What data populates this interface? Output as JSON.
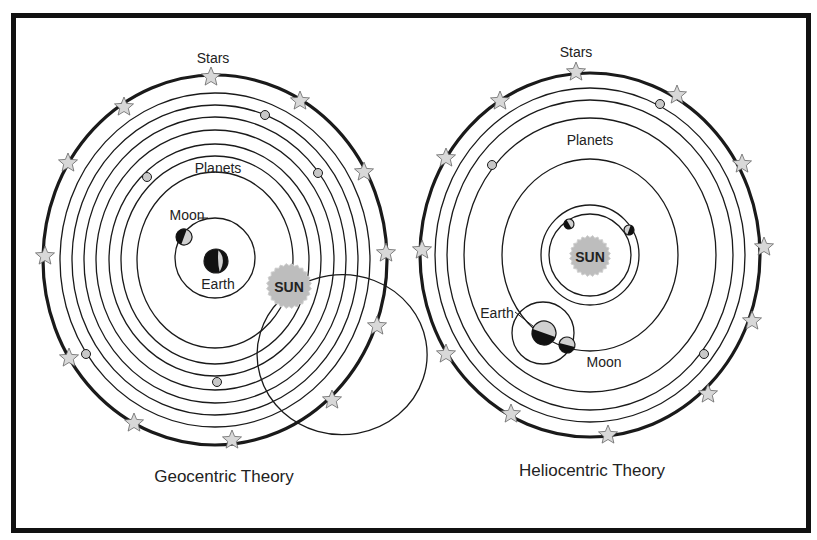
{
  "geocentric": {
    "title": "Geocentric Theory",
    "labels": {
      "stars": "Stars",
      "planets": "Planets",
      "moon": "Moon",
      "earth": "Earth",
      "sun": "SUN"
    },
    "center": [
      215,
      260
    ],
    "outer": [
      172,
      185
    ],
    "orbits": [
      [
        155,
        167
      ],
      [
        143,
        155
      ],
      [
        131,
        143
      ],
      [
        119,
        130
      ],
      [
        106,
        116
      ],
      [
        94,
        104
      ],
      [
        78,
        88
      ]
    ],
    "planets": [
      [
        265,
        115
      ],
      [
        318,
        173
      ],
      [
        147,
        177
      ],
      [
        86,
        354
      ],
      [
        217,
        382
      ]
    ],
    "stars": [
      [
        211,
        77
      ],
      [
        124,
        107
      ],
      [
        300,
        101
      ],
      [
        68,
        163
      ],
      [
        364,
        172
      ],
      [
        45,
        256
      ],
      [
        386,
        253
      ],
      [
        69,
        358
      ],
      [
        377,
        326
      ],
      [
        134,
        423
      ],
      [
        332,
        400
      ],
      [
        232,
        440
      ]
    ]
  },
  "heliocentric": {
    "title": "Heliocentric Theory",
    "labels": {
      "stars": "Stars",
      "planets": "Planets",
      "earth": "Earth",
      "moon": "Moon",
      "sun": "SUN"
    },
    "center": [
      590,
      255
    ],
    "outer": [
      170,
      182
    ],
    "orbits": [
      [
        155,
        167
      ],
      [
        143,
        155
      ],
      [
        126,
        137
      ],
      [
        88,
        96
      ],
      [
        49,
        50
      ],
      [
        41,
        41
      ]
    ],
    "planets": [
      [
        660,
        104
      ],
      [
        492,
        165
      ],
      [
        569,
        224
      ],
      [
        629,
        230
      ],
      [
        704,
        354
      ]
    ],
    "stars": [
      [
        576,
        72
      ],
      [
        500,
        101
      ],
      [
        677,
        95
      ],
      [
        446,
        158
      ],
      [
        742,
        164
      ],
      [
        422,
        250
      ],
      [
        764,
        247
      ],
      [
        446,
        354
      ],
      [
        752,
        321
      ],
      [
        511,
        414
      ],
      [
        708,
        394
      ],
      [
        608,
        435
      ]
    ]
  },
  "colors": {
    "line": "#1a1a1a",
    "planet": "#c8c8c8",
    "star": "#d8d8d8",
    "sun": "#bdbdbd"
  }
}
